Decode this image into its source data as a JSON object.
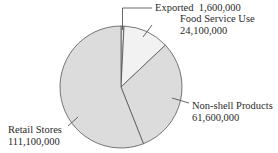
{
  "chart_data": {
    "type": "pie",
    "title": "",
    "categories": [
      "Exported",
      "Food Service Use",
      "Non-shell Products",
      "Retail Stores"
    ],
    "values": [
      1600000,
      24100000,
      61600000,
      111100000
    ],
    "colors": [
      "#e2e2e2",
      "#f2f2f2",
      "#dcdcdc",
      "#dcdcdc"
    ],
    "start_angle": "12 o'clock",
    "direction": "clockwise",
    "legend": "none (callout labels)",
    "labels": [
      {
        "name": "Exported",
        "value_text": "1,600,000"
      },
      {
        "name": "Food Service Use",
        "value_text": "24,100,000"
      },
      {
        "name": "Non-shell Products",
        "value_text": "61,600,000"
      },
      {
        "name": "Retail Stores",
        "value_text": "111,100,000"
      }
    ]
  }
}
